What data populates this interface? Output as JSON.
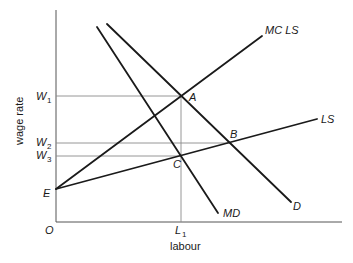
{
  "diagram": {
    "axes": {
      "x_label": "labour",
      "y_label": "wage rate",
      "origin_label": "O",
      "x_ticks": [
        {
          "label": "L",
          "sub": "1",
          "x": 181
        }
      ],
      "y_ticks": [
        {
          "label": "W",
          "sub": "1",
          "y": 96
        },
        {
          "label": "W",
          "sub": "2",
          "y": 143
        },
        {
          "label": "W",
          "sub": "3",
          "y": 156
        }
      ]
    },
    "curves": [
      {
        "id": "mc-ls",
        "label": "MC LS",
        "from": [
          56,
          189
        ],
        "to": [
          262,
          36
        ]
      },
      {
        "id": "ls",
        "label": "LS",
        "from": [
          56,
          189
        ],
        "to": [
          317,
          119
        ]
      },
      {
        "id": "md",
        "label": "MD",
        "from": [
          97,
          27
        ],
        "to": [
          218,
          213
        ]
      },
      {
        "id": "d",
        "label": "D",
        "from": [
          107,
          24
        ],
        "to": [
          291,
          202
        ]
      }
    ],
    "points": [
      {
        "label": "A",
        "x": 181,
        "y": 96
      },
      {
        "label": "B",
        "x": 231,
        "y": 143
      },
      {
        "label": "C",
        "x": 181,
        "y": 156
      },
      {
        "label": "E",
        "x": 56,
        "y": 189
      }
    ],
    "labels": {
      "mc_ls": "MC LS",
      "ls": "LS",
      "md": "MD",
      "d": "D",
      "a": "A",
      "b": "B",
      "c": "C",
      "e": "E",
      "o": "O",
      "w": "W",
      "w1_sub": "1",
      "w2_sub": "2",
      "w3_sub": "3",
      "l": "L",
      "l1_sub": "1",
      "x_axis_title": "labour",
      "y_axis_title": "wage rate"
    }
  }
}
